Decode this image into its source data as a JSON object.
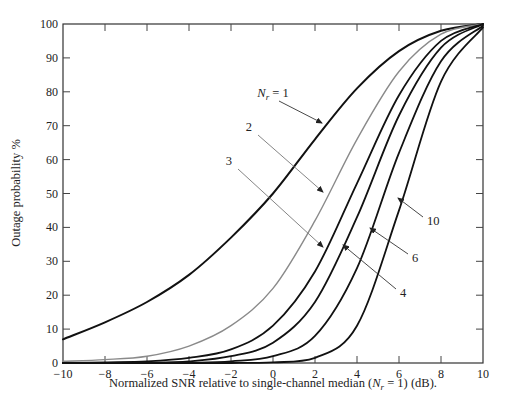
{
  "chart_data": {
    "type": "line",
    "title": "",
    "xlabel": "Normalized SNR relative to single-channel median (N_r = 1) (dB).",
    "xlabel_parts": {
      "pre": "Normalized SNR relative to single-channel median (",
      "var": "N",
      "sub": "r",
      "post": " = 1) (dB)."
    },
    "ylabel": "Outage probability %",
    "xlim": [
      -10,
      10
    ],
    "ylim": [
      0,
      100
    ],
    "xticks": [
      -10,
      -8,
      -6,
      -4,
      -2,
      0,
      2,
      4,
      6,
      8,
      10
    ],
    "yticks": [
      0,
      10,
      20,
      30,
      40,
      50,
      60,
      70,
      80,
      90,
      100
    ],
    "grid": false,
    "legend": "inline annotations with arrows",
    "x": [
      -10,
      -8,
      -6,
      -4,
      -2,
      0,
      2,
      4,
      6,
      8,
      10
    ],
    "series": [
      {
        "name": "N_r = 1",
        "label": "N_r = 1",
        "color": "#111111",
        "width": 2.0,
        "values": [
          7,
          12,
          18,
          26,
          37,
          50,
          66,
          81,
          92,
          98,
          100
        ]
      },
      {
        "name": "N_r = 2",
        "label": "2",
        "color": "#8a8a8a",
        "width": 1.4,
        "values": [
          0.5,
          1,
          2,
          5,
          11,
          22,
          42,
          66,
          86,
          97,
          100
        ]
      },
      {
        "name": "N_r = 3",
        "label": "3",
        "color": "#111111",
        "width": 1.8,
        "values": [
          0,
          0.2,
          0.5,
          1.5,
          4,
          11,
          27,
          53,
          79,
          95,
          100
        ]
      },
      {
        "name": "N_r = 4",
        "label": "4",
        "color": "#111111",
        "width": 1.8,
        "values": [
          0,
          0,
          0.1,
          0.5,
          2,
          6,
          18,
          43,
          73,
          93,
          100
        ]
      },
      {
        "name": "N_r = 6",
        "label": "6",
        "color": "#111111",
        "width": 1.8,
        "values": [
          0,
          0,
          0,
          0.1,
          0.5,
          2,
          8,
          28,
          62,
          89,
          99.5
        ]
      },
      {
        "name": "N_r = 10",
        "label": "10",
        "color": "#111111",
        "width": 1.8,
        "values": [
          0,
          0,
          0,
          0,
          0,
          0.2,
          1.5,
          11,
          45,
          83,
          99
        ]
      }
    ],
    "annotations": [
      {
        "text": "N_r = 1",
        "series": "N_r = 1",
        "text_xy": [
          273,
          97
        ],
        "arrow_to": [
          322,
          123
        ]
      },
      {
        "text": "2",
        "series": "N_r = 2",
        "text_xy": [
          252,
          131
        ],
        "arrow_to": [
          323,
          192
        ]
      },
      {
        "text": "3",
        "series": "N_r = 3",
        "text_xy": [
          232,
          165
        ],
        "arrow_to": [
          323,
          247
        ]
      },
      {
        "text": "4",
        "series": "N_r = 4",
        "text_xy": [
          400,
          297
        ],
        "arrow_to": [
          343,
          245
        ]
      },
      {
        "text": "6",
        "series": "N_r = 6",
        "text_xy": [
          412,
          262
        ],
        "arrow_to": [
          370,
          228
        ]
      },
      {
        "text": "10",
        "series": "N_r = 10",
        "text_xy": [
          427,
          225
        ],
        "arrow_to": [
          398,
          198
        ]
      }
    ]
  }
}
